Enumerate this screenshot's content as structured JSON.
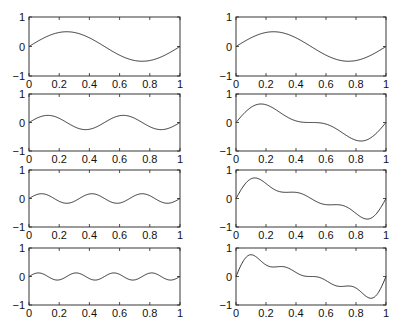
{
  "chart_data": {
    "type": "line",
    "layout": "4 rows x 2 columns",
    "panels": [
      {
        "row": 1,
        "col": 1,
        "name": "harmonic-1",
        "components": [
          {
            "k": 1,
            "amp": 0.5
          }
        ],
        "xlim": [
          0,
          1
        ],
        "ylim": [
          -1,
          1
        ],
        "xticks": [
          "0",
          "0.2",
          "0.4",
          "0.6",
          "0.8",
          "1"
        ],
        "yticks": [
          "-1",
          "0",
          "1"
        ]
      },
      {
        "row": 1,
        "col": 2,
        "name": "partial-sum-1",
        "components": [
          {
            "k": 1,
            "amp": 0.5
          }
        ],
        "xlim": [
          0,
          1
        ],
        "ylim": [
          -1,
          1
        ],
        "xticks": [
          "0",
          "0.2",
          "0.4",
          "0.6",
          "0.8",
          "1"
        ],
        "yticks": [
          "-1",
          "0",
          "1"
        ]
      },
      {
        "row": 2,
        "col": 1,
        "name": "harmonic-2",
        "components": [
          {
            "k": 2,
            "amp": 0.25
          }
        ],
        "xlim": [
          0,
          1
        ],
        "ylim": [
          -1,
          1
        ],
        "xticks": [
          "0",
          "0.2",
          "0.4",
          "0.6",
          "0.8",
          "1"
        ],
        "yticks": [
          "-1",
          "0",
          "1"
        ]
      },
      {
        "row": 2,
        "col": 2,
        "name": "partial-sum-2",
        "components": [
          {
            "k": 1,
            "amp": 0.5
          },
          {
            "k": 2,
            "amp": 0.25
          }
        ],
        "xlim": [
          0,
          1
        ],
        "ylim": [
          -1,
          1
        ],
        "xticks": [
          "0",
          "0.2",
          "0.4",
          "0.6",
          "0.8",
          "1"
        ],
        "yticks": [
          "-1",
          "0",
          "1"
        ]
      },
      {
        "row": 3,
        "col": 1,
        "name": "harmonic-3",
        "components": [
          {
            "k": 3,
            "amp": 0.167
          }
        ],
        "xlim": [
          0,
          1
        ],
        "ylim": [
          -1,
          1
        ],
        "xticks": [
          "0",
          "0.2",
          "0.4",
          "0.6",
          "0.8",
          "1"
        ],
        "yticks": [
          "-1",
          "0",
          "1"
        ]
      },
      {
        "row": 3,
        "col": 2,
        "name": "partial-sum-3",
        "components": [
          {
            "k": 1,
            "amp": 0.5
          },
          {
            "k": 2,
            "amp": 0.25
          },
          {
            "k": 3,
            "amp": 0.167
          }
        ],
        "xlim": [
          0,
          1
        ],
        "ylim": [
          -1,
          1
        ],
        "xticks": [
          "0",
          "0.2",
          "0.4",
          "0.6",
          "0.8",
          "1"
        ],
        "yticks": [
          "-1",
          "0",
          "1"
        ]
      },
      {
        "row": 4,
        "col": 1,
        "name": "harmonic-4",
        "components": [
          {
            "k": 4,
            "amp": 0.125
          }
        ],
        "xlim": [
          0,
          1
        ],
        "ylim": [
          -1,
          1
        ],
        "xticks": [
          "0",
          "0.2",
          "0.4",
          "0.6",
          "0.8",
          "1"
        ],
        "yticks": [
          "-1",
          "0",
          "1"
        ]
      },
      {
        "row": 4,
        "col": 2,
        "name": "partial-sum-4",
        "components": [
          {
            "k": 1,
            "amp": 0.5
          },
          {
            "k": 2,
            "amp": 0.25
          },
          {
            "k": 3,
            "amp": 0.167
          },
          {
            "k": 4,
            "amp": 0.125
          }
        ],
        "xlim": [
          0,
          1
        ],
        "ylim": [
          -1,
          1
        ],
        "xticks": [
          "0",
          "0.2",
          "0.4",
          "0.6",
          "0.8",
          "1"
        ],
        "yticks": [
          "-1",
          "0",
          "1"
        ]
      }
    ],
    "title": "",
    "xlabel": "",
    "ylabel": "",
    "grid": false,
    "legend": "none"
  }
}
